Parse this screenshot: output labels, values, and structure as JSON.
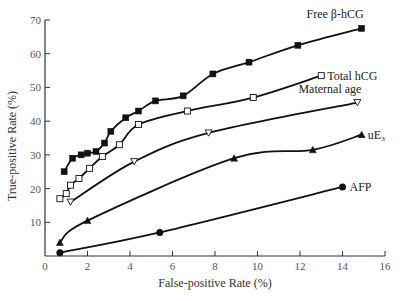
{
  "chart_data": {
    "type": "line",
    "title": "",
    "xlabel": "False-positive Rate (%)",
    "ylabel": "True-positive Rate (%)",
    "xlim": [
      0,
      16
    ],
    "ylim": [
      0,
      70
    ],
    "xticks": [
      0,
      2,
      4,
      6,
      8,
      10,
      12,
      14,
      16
    ],
    "yticks": [
      10,
      20,
      30,
      40,
      50,
      60,
      70
    ],
    "grid": false,
    "legend": "inline labels at line ends (right)",
    "series": [
      {
        "name": "Free β-hCG",
        "marker": "filled-square",
        "x": [
          0.9,
          1.3,
          1.7,
          2.0,
          2.4,
          2.8,
          3.1,
          3.8,
          4.4,
          5.2,
          6.5,
          7.9,
          9.6,
          11.9,
          14.9
        ],
        "y": [
          25,
          29,
          30,
          30.5,
          31,
          33.5,
          37,
          41,
          43,
          46,
          47.5,
          54,
          57.5,
          62.5,
          67.5
        ]
      },
      {
        "name": "Total hCG",
        "marker": "open-square",
        "x": [
          0.7,
          1.0,
          1.2,
          1.6,
          2.1,
          2.7,
          3.5,
          4.4,
          6.7,
          9.8,
          13.0
        ],
        "y": [
          17,
          18.5,
          21,
          23,
          26,
          29.5,
          33,
          39,
          43,
          47,
          53.5
        ]
      },
      {
        "name": "Maternal age",
        "marker": "open-triangle-down",
        "x": [
          1.2,
          4.2,
          7.7,
          14.7
        ],
        "y": [
          16,
          28,
          36.5,
          45.5
        ]
      },
      {
        "name": "uE₃",
        "marker": "filled-triangle-up",
        "x": [
          0.7,
          2.0,
          8.9,
          12.6,
          14.9
        ],
        "y": [
          4,
          10.5,
          29,
          31.5,
          36
        ]
      },
      {
        "name": "AFP",
        "marker": "filled-circle",
        "x": [
          0.7,
          5.4,
          14.0
        ],
        "y": [
          1,
          7,
          20.5
        ]
      }
    ]
  }
}
